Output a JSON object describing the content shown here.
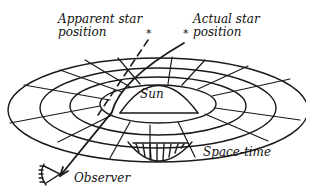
{
  "diagram": {
    "labels": {
      "apparent_star": [
        "Apparent star",
        "position"
      ],
      "actual_star": [
        "Actual star",
        "position"
      ],
      "sun": "Sun",
      "spacetime": "Space-time",
      "observer": "Observer"
    },
    "markers": {
      "apparent_star_symbol": "*",
      "actual_star_symbol": "*"
    },
    "elements": [
      {
        "id": "spacetime-grid",
        "shape": "concentric-ellipses",
        "count": 4
      },
      {
        "id": "sun",
        "shape": "sphere-in-funnel"
      },
      {
        "id": "actual-light-path",
        "style": "solid",
        "from": "actual-star",
        "to": "observer",
        "bends_near": "sun"
      },
      {
        "id": "apparent-line-of-sight",
        "style": "dashed",
        "from": "observer",
        "to": "apparent-star"
      },
      {
        "id": "observer-eye",
        "shape": "eye-icon"
      }
    ],
    "colors": {
      "ink": "#111111",
      "background": "#ffffff"
    }
  }
}
